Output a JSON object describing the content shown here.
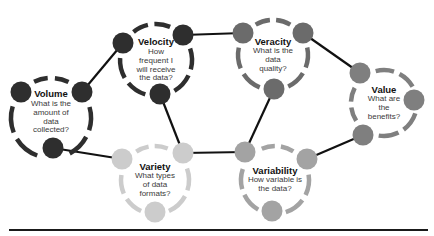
{
  "diagram": {
    "nodes": [
      {
        "id": "volume",
        "title": "Volume",
        "question": "What is the amount of data collected?",
        "lines": [
          "What is the",
          "amount of",
          "data",
          "collected?"
        ],
        "color": "#2e2e2e",
        "cx": 51,
        "cy": 118,
        "r": 40,
        "dots": [
          [
            21,
            92
          ],
          [
            82,
            92
          ],
          [
            53,
            148
          ]
        ]
      },
      {
        "id": "velocity",
        "title": "Velocity",
        "question": "How frequent I will receive the data?",
        "lines": [
          "How",
          "frequent I",
          "will receive",
          "the data?"
        ],
        "color": "#2e2e2e",
        "cx": 156,
        "cy": 60,
        "r": 36,
        "dots": [
          [
            123,
            43
          ],
          [
            183,
            35
          ],
          [
            160,
            94
          ]
        ]
      },
      {
        "id": "veracity",
        "title": "Veracity",
        "question": "What is the data quality?",
        "lines": [
          "What is the",
          "data",
          "quality?"
        ],
        "color": "#6b6b6b",
        "cx": 273,
        "cy": 55,
        "r": 35,
        "dots": [
          [
            243,
            33
          ],
          [
            303,
            33
          ],
          [
            274,
            89
          ]
        ]
      },
      {
        "id": "value",
        "title": "Value",
        "question": "What are the benefits?",
        "lines": [
          "What are",
          "the",
          "benefits?"
        ],
        "color": "#7f7f7f",
        "cx": 384,
        "cy": 103,
        "r": 33,
        "dots": [
          [
            360,
            73
          ],
          [
            414,
            100
          ],
          [
            363,
            135
          ]
        ]
      },
      {
        "id": "variety",
        "title": "Variety",
        "question": "What types of data formats?",
        "lines": [
          "What types",
          "of data",
          "formats?"
        ],
        "color": "#cccccc",
        "cx": 155,
        "cy": 180,
        "r": 34,
        "dots": [
          [
            122,
            159
          ],
          [
            183,
            153
          ],
          [
            155,
            212
          ]
        ]
      },
      {
        "id": "variability",
        "title": "Variability",
        "question": "How variable is the data?",
        "lines": [
          "How variable is",
          "the data?"
        ],
        "color": "#a3a3a3",
        "cx": 275,
        "cy": 180,
        "r": 34,
        "dots": [
          [
            245,
            152
          ],
          [
            307,
            159
          ],
          [
            272,
            211
          ]
        ]
      }
    ],
    "edges": [
      {
        "from": "volume",
        "to": "velocity",
        "x1": 82,
        "y1": 92,
        "x2": 123,
        "y2": 43
      },
      {
        "from": "volume",
        "to": "variety",
        "x1": 53,
        "y1": 148,
        "x2": 122,
        "y2": 159
      },
      {
        "from": "velocity",
        "to": "veracity",
        "x1": 183,
        "y1": 35,
        "x2": 243,
        "y2": 33
      },
      {
        "from": "velocity",
        "to": "variety",
        "x1": 160,
        "y1": 94,
        "x2": 183,
        "y2": 153
      },
      {
        "from": "veracity",
        "to": "value",
        "x1": 303,
        "y1": 33,
        "x2": 360,
        "y2": 73
      },
      {
        "from": "veracity",
        "to": "variability",
        "x1": 274,
        "y1": 89,
        "x2": 245,
        "y2": 152
      },
      {
        "from": "variety",
        "to": "variability",
        "x1": 183,
        "y1": 153,
        "x2": 245,
        "y2": 152
      },
      {
        "from": "variability",
        "to": "value",
        "x1": 307,
        "y1": 159,
        "x2": 363,
        "y2": 135
      }
    ],
    "edge_color": "#111111",
    "rule_color": "#1a1a1a"
  }
}
